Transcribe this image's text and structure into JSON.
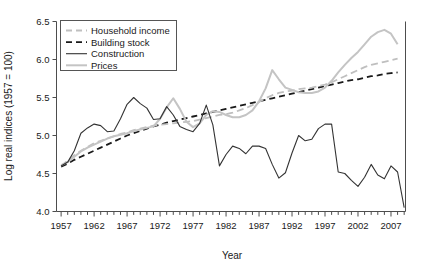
{
  "chart_data": {
    "type": "line",
    "title": "",
    "xlabel": "Year",
    "ylabel": "Log real indices (1957 = 100)",
    "xlim": [
      1956.3,
      2009.2
    ],
    "ylim": [
      4.0,
      6.5
    ],
    "grid": false,
    "legend_position": "upper left",
    "x_major_ticks": [
      1957,
      1962,
      1967,
      1972,
      1977,
      1982,
      1987,
      1992,
      1997,
      2002,
      2007
    ],
    "x_major_tick_labels": [
      "1957",
      "1962",
      "1967",
      "1972",
      "1977",
      "1982",
      "1987",
      "1992",
      "1997",
      "2002",
      "2007"
    ],
    "x_minor_tick_interval": 1,
    "y_ticks": [
      4.0,
      4.5,
      5.0,
      5.5,
      6.0,
      6.5
    ],
    "y_tick_labels": [
      "4.0",
      "4.5",
      "5.0",
      "5.5",
      "6.0",
      "6.5"
    ],
    "x": [
      1957,
      1958,
      1959,
      1960,
      1961,
      1962,
      1963,
      1964,
      1965,
      1966,
      1967,
      1968,
      1969,
      1970,
      1971,
      1972,
      1973,
      1974,
      1975,
      1976,
      1977,
      1978,
      1979,
      1980,
      1981,
      1982,
      1983,
      1984,
      1985,
      1986,
      1987,
      1988,
      1989,
      1990,
      1991,
      1992,
      1993,
      1994,
      1995,
      1996,
      1997,
      1998,
      1999,
      2000,
      2001,
      2002,
      2003,
      2004,
      2005,
      2006,
      2007,
      2008
    ],
    "series": [
      {
        "name": "Household income",
        "style": "dashed",
        "color": "#bfbfbf",
        "width": 1.8,
        "values": [
          4.6,
          4.67,
          4.74,
          4.8,
          4.85,
          4.9,
          4.93,
          4.96,
          4.99,
          5.02,
          5.04,
          5.07,
          5.09,
          5.11,
          5.13,
          5.14,
          5.15,
          5.16,
          5.17,
          5.18,
          5.19,
          5.21,
          5.23,
          5.25,
          5.27,
          5.28,
          5.3,
          5.33,
          5.36,
          5.4,
          5.44,
          5.49,
          5.53,
          5.56,
          5.58,
          5.59,
          5.61,
          5.62,
          5.63,
          5.65,
          5.67,
          5.7,
          5.74,
          5.78,
          5.82,
          5.86,
          5.9,
          5.93,
          5.95,
          5.97,
          5.99,
          6.01
        ]
      },
      {
        "name": "Building stock",
        "style": "dashed",
        "color": "#1a1a1a",
        "width": 1.8,
        "values": [
          4.59,
          4.63,
          4.68,
          4.72,
          4.76,
          4.8,
          4.84,
          4.88,
          4.92,
          4.96,
          5.0,
          5.03,
          5.06,
          5.09,
          5.12,
          5.14,
          5.17,
          5.19,
          5.21,
          5.23,
          5.25,
          5.27,
          5.29,
          5.31,
          5.33,
          5.35,
          5.37,
          5.39,
          5.41,
          5.43,
          5.45,
          5.47,
          5.49,
          5.51,
          5.53,
          5.55,
          5.57,
          5.59,
          5.61,
          5.63,
          5.65,
          5.67,
          5.69,
          5.71,
          5.73,
          5.74,
          5.76,
          5.78,
          5.79,
          5.81,
          5.82,
          5.83
        ]
      },
      {
        "name": "Construction",
        "style": "solid",
        "color": "#333333",
        "width": 1.1,
        "values": [
          4.6,
          4.65,
          4.8,
          5.03,
          5.1,
          5.15,
          5.13,
          5.05,
          5.06,
          5.22,
          5.41,
          5.5,
          5.42,
          5.36,
          5.21,
          5.22,
          5.38,
          5.27,
          5.12,
          5.08,
          5.05,
          5.16,
          5.4,
          5.14,
          4.6,
          4.75,
          4.86,
          4.83,
          4.76,
          4.86,
          4.86,
          4.83,
          4.62,
          4.44,
          4.51,
          4.77,
          5.0,
          4.93,
          4.95,
          5.09,
          5.15,
          5.15,
          4.52,
          4.5,
          4.41,
          4.33,
          4.45,
          4.62,
          4.48,
          4.43,
          4.6,
          4.52
        ]
      },
      {
        "name": "Prices",
        "style": "solid",
        "color": "#c4c4c4",
        "width": 2.0,
        "values": [
          4.61,
          4.65,
          4.72,
          4.79,
          4.84,
          4.88,
          4.92,
          4.96,
          4.99,
          5.01,
          5.03,
          5.06,
          5.08,
          5.1,
          5.12,
          5.22,
          5.37,
          5.49,
          5.35,
          5.18,
          5.11,
          5.16,
          5.27,
          5.32,
          5.31,
          5.27,
          5.24,
          5.24,
          5.27,
          5.33,
          5.45,
          5.62,
          5.86,
          5.74,
          5.63,
          5.6,
          5.57,
          5.56,
          5.56,
          5.58,
          5.63,
          5.72,
          5.83,
          5.93,
          6.02,
          6.1,
          6.2,
          6.3,
          6.36,
          6.39,
          6.34,
          6.2
        ]
      }
    ],
    "extra_construction_tail": {
      "note": "Construction falls steeply at the series end",
      "x": [
        2007,
        2008,
        2009
      ],
      "values": [
        4.6,
        4.52,
        4.05
      ]
    }
  },
  "legend": {
    "items": [
      {
        "label": "Household income"
      },
      {
        "label": "Building stock"
      },
      {
        "label": "Construction"
      },
      {
        "label": "Prices"
      }
    ]
  }
}
